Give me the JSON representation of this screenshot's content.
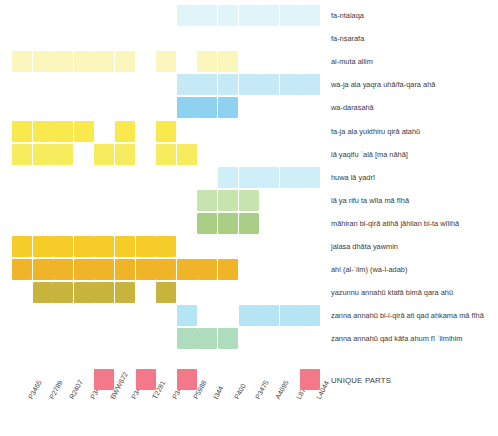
{
  "chart_data": {
    "type": "heatmap",
    "title": "",
    "xlabel": "",
    "ylabel": "",
    "grid": false,
    "legend_position": "bottom-right",
    "geometry": {
      "origin_x": 12,
      "origin_y": 5,
      "cell_width": 20,
      "cell_height": 21,
      "col_step": 20.6,
      "row_step": 23.1,
      "label_x": 331
    },
    "categories": [
      "P3465",
      "P2789",
      "R2407",
      "P3473",
      "BWW672",
      "P3466",
      "T2281",
      "P3471",
      "P5988",
      "I344",
      "P400",
      "P3475",
      "A4095",
      "L8751",
      "L4044"
    ],
    "rows": [
      "fa-ntalaqa",
      "fa-nṣarafa",
      "al-muta allim",
      "wa-ja ala yaqra uhā/fa-qara ahā",
      "wa-darasahā",
      "fa-ja ala yukthiru qirā atahū",
      "lā yaqifu ʿalā [ma nāhā]",
      "huwa lā yadrī",
      "lā ya rifu ta wīla mā fīhā",
      "māhiran bi-qirā atihā jāhilan bi-ta wīlihā",
      "jalasa dhāta yawmin",
      "ahl (al-ʿilm) (wa-l-adab)",
      "yazunnu annahū ktafā bimā qara ahū",
      "ẓanna annahū bi-l-qirā ati qad aḥkama mā fīhā",
      "ẓanna annahū qad kāfa ahum fī ʿilmihim"
    ],
    "colors": {
      "pale_cyan": "#E6F7FB",
      "light_cyan": "#CFEFF8",
      "cyan": "#B5E4F5",
      "blue": "#8FD2F0",
      "pale_yellow": "#FBFBE0",
      "light_yellow": "#FAF7C2",
      "yellow": "#F7EC5E",
      "bright_yellow": "#FAE94C",
      "gold": "#F5CC28",
      "orange": "#F0B428",
      "olive": "#C8B43C",
      "pale_green": "#DCEFCC",
      "light_green": "#C7E3AE",
      "green": "#A9CE85",
      "mint": "#AEDCBC",
      "pink": "#F2788A",
      "white": "#FFFFFF"
    },
    "cells": [
      {
        "row": 0,
        "col": 8,
        "color": "#E0F5FA"
      },
      {
        "row": 0,
        "col": 9,
        "color": "#E0F5FA"
      },
      {
        "row": 0,
        "col": 10,
        "color": "#E0F5FA"
      },
      {
        "row": 0,
        "col": 11,
        "color": "#E0F5FA"
      },
      {
        "row": 0,
        "col": 12,
        "color": "#E0F5FA"
      },
      {
        "row": 0,
        "col": 13,
        "color": "#E0F5FA"
      },
      {
        "row": 0,
        "col": 14,
        "color": "#E0F5FA"
      },
      {
        "row": 2,
        "col": 0,
        "color": "#FAF6BC"
      },
      {
        "row": 2,
        "col": 1,
        "color": "#FAF6BC"
      },
      {
        "row": 2,
        "col": 2,
        "color": "#FAF6BC"
      },
      {
        "row": 2,
        "col": 3,
        "color": "#FAF6BC"
      },
      {
        "row": 2,
        "col": 4,
        "color": "#FAF6BC"
      },
      {
        "row": 2,
        "col": 5,
        "color": "#FAF6BC"
      },
      {
        "row": 2,
        "col": 7,
        "color": "#FAF6BC"
      },
      {
        "row": 2,
        "col": 9,
        "color": "#FAF6BC"
      },
      {
        "row": 2,
        "col": 10,
        "color": "#FAF6BC"
      },
      {
        "row": 3,
        "col": 8,
        "color": "#C5E9F7"
      },
      {
        "row": 3,
        "col": 9,
        "color": "#C5E9F7"
      },
      {
        "row": 3,
        "col": 10,
        "color": "#C5E9F7"
      },
      {
        "row": 3,
        "col": 11,
        "color": "#C5E9F7"
      },
      {
        "row": 3,
        "col": 12,
        "color": "#C5E9F7"
      },
      {
        "row": 3,
        "col": 13,
        "color": "#C5E9F7"
      },
      {
        "row": 3,
        "col": 14,
        "color": "#C5E9F7"
      },
      {
        "row": 4,
        "col": 8,
        "color": "#8FD2F0"
      },
      {
        "row": 4,
        "col": 9,
        "color": "#8FD2F0"
      },
      {
        "row": 4,
        "col": 10,
        "color": "#8FD2F0"
      },
      {
        "row": 5,
        "col": 0,
        "color": "#FAE94C"
      },
      {
        "row": 5,
        "col": 1,
        "color": "#FAE94C"
      },
      {
        "row": 5,
        "col": 2,
        "color": "#FAE94C"
      },
      {
        "row": 5,
        "col": 3,
        "color": "#FAE94C"
      },
      {
        "row": 5,
        "col": 5,
        "color": "#FAE94C"
      },
      {
        "row": 5,
        "col": 7,
        "color": "#FAE94C"
      },
      {
        "row": 6,
        "col": 0,
        "color": "#F7EC5E"
      },
      {
        "row": 6,
        "col": 1,
        "color": "#F7EC5E"
      },
      {
        "row": 6,
        "col": 2,
        "color": "#F7EC5E"
      },
      {
        "row": 6,
        "col": 4,
        "color": "#F7EC5E"
      },
      {
        "row": 6,
        "col": 5,
        "color": "#F7EC5E"
      },
      {
        "row": 6,
        "col": 7,
        "color": "#F7EC5E"
      },
      {
        "row": 6,
        "col": 8,
        "color": "#F7EC5E"
      },
      {
        "row": 7,
        "col": 10,
        "color": "#CFEFF8"
      },
      {
        "row": 7,
        "col": 11,
        "color": "#CFEFF8"
      },
      {
        "row": 7,
        "col": 12,
        "color": "#CFEFF8"
      },
      {
        "row": 7,
        "col": 13,
        "color": "#CFEFF8"
      },
      {
        "row": 7,
        "col": 14,
        "color": "#CFEFF8"
      },
      {
        "row": 8,
        "col": 9,
        "color": "#C7E3AE"
      },
      {
        "row": 8,
        "col": 10,
        "color": "#C7E3AE"
      },
      {
        "row": 8,
        "col": 11,
        "color": "#C7E3AE"
      },
      {
        "row": 9,
        "col": 9,
        "color": "#A9CE85"
      },
      {
        "row": 9,
        "col": 10,
        "color": "#A9CE85"
      },
      {
        "row": 9,
        "col": 11,
        "color": "#A9CE85"
      },
      {
        "row": 10,
        "col": 0,
        "color": "#F5CC28"
      },
      {
        "row": 10,
        "col": 1,
        "color": "#F5CC28"
      },
      {
        "row": 10,
        "col": 2,
        "color": "#F5CC28"
      },
      {
        "row": 10,
        "col": 3,
        "color": "#F5CC28"
      },
      {
        "row": 10,
        "col": 4,
        "color": "#F5CC28"
      },
      {
        "row": 10,
        "col": 5,
        "color": "#F5CC28"
      },
      {
        "row": 10,
        "col": 6,
        "color": "#F5CC28"
      },
      {
        "row": 10,
        "col": 7,
        "color": "#F5CC28"
      },
      {
        "row": 11,
        "col": 0,
        "color": "#F0B428"
      },
      {
        "row": 11,
        "col": 1,
        "color": "#F0B428"
      },
      {
        "row": 11,
        "col": 2,
        "color": "#F0B428"
      },
      {
        "row": 11,
        "col": 3,
        "color": "#F0B428"
      },
      {
        "row": 11,
        "col": 4,
        "color": "#F0B428"
      },
      {
        "row": 11,
        "col": 5,
        "color": "#F0B428"
      },
      {
        "row": 11,
        "col": 6,
        "color": "#F0B428"
      },
      {
        "row": 11,
        "col": 7,
        "color": "#F0B428"
      },
      {
        "row": 11,
        "col": 8,
        "color": "#F0B428"
      },
      {
        "row": 11,
        "col": 9,
        "color": "#F0B428"
      },
      {
        "row": 11,
        "col": 10,
        "color": "#F0B428"
      },
      {
        "row": 12,
        "col": 1,
        "color": "#C8B43C"
      },
      {
        "row": 12,
        "col": 2,
        "color": "#C8B43C"
      },
      {
        "row": 12,
        "col": 3,
        "color": "#C8B43C"
      },
      {
        "row": 12,
        "col": 4,
        "color": "#C8B43C"
      },
      {
        "row": 12,
        "col": 5,
        "color": "#C8B43C"
      },
      {
        "row": 12,
        "col": 7,
        "color": "#C8B43C"
      },
      {
        "row": 13,
        "col": 8,
        "color": "#B5E4F5"
      },
      {
        "row": 13,
        "col": 11,
        "color": "#B5E4F5"
      },
      {
        "row": 13,
        "col": 12,
        "color": "#B5E4F5"
      },
      {
        "row": 13,
        "col": 13,
        "color": "#B5E4F5"
      },
      {
        "row": 13,
        "col": 14,
        "color": "#B5E4F5"
      },
      {
        "row": 14,
        "col": 8,
        "color": "#AEDCBC"
      },
      {
        "row": 14,
        "col": 9,
        "color": "#AEDCBC"
      },
      {
        "row": 14,
        "col": 10,
        "color": "#AEDCBC"
      }
    ],
    "unique_parts": {
      "label": "UNIQUE PARTS",
      "color": "#F2788A",
      "columns": [
        4,
        6,
        8,
        14
      ]
    }
  }
}
